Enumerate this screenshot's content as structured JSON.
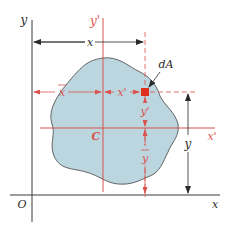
{
  "colors": {
    "axis": "#3a3a3a",
    "centroidal": "#d9534f",
    "area_fill": "#bcd6e0",
    "area_stroke": "#555555",
    "element": "#e0301e",
    "dimension": "#2a2a2a"
  },
  "labels": {
    "y_axis": "y",
    "x_axis": "x",
    "origin": "O",
    "y_prime_axis": "y'",
    "x_prime_axis": "x'",
    "centroid": "C",
    "element": "dA",
    "dim_x": "x",
    "dim_x_bar": "x",
    "dim_x_prime": "x'",
    "dim_y": "y",
    "dim_y_bar": "y",
    "dim_y_prime": "y'"
  }
}
